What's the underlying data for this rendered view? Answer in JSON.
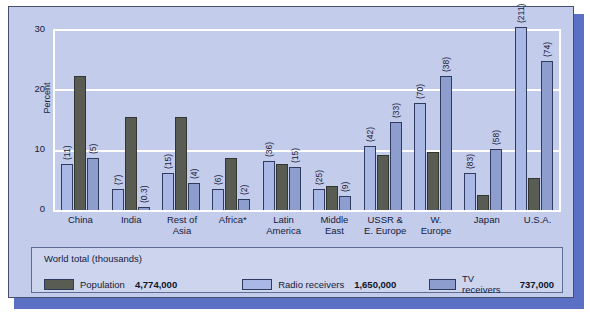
{
  "chart_data": {
    "type": "bar",
    "title": "",
    "xlabel": "",
    "ylabel": "Percent",
    "ylim": [
      0,
      30
    ],
    "yticks": [
      0,
      10,
      20,
      30
    ],
    "grid": true,
    "legend_position": "bottom-panel",
    "categories": [
      "China",
      "India",
      "Rest of Asia",
      "Africa*",
      "Latin America",
      "Middle East",
      "USSR & E. Europe",
      "W. Europe",
      "Japan",
      "U.S.A."
    ],
    "category_lines": [
      [
        "China"
      ],
      [
        "India"
      ],
      [
        "Rest of",
        "Asia"
      ],
      [
        "Africa*"
      ],
      [
        "Latin",
        "America"
      ],
      [
        "Middle",
        "East"
      ],
      [
        "USSR &",
        "E. Europe"
      ],
      [
        "W.",
        "Europe"
      ],
      [
        "Japan"
      ],
      [
        "U.S.A."
      ]
    ],
    "series": [
      {
        "name": "Radio receivers",
        "color": "#a9b8e4",
        "values": [
          7.5,
          3.5,
          6.0,
          3.5,
          8.0,
          3.5,
          10.5,
          17.5,
          6.0,
          30.0
        ]
      },
      {
        "name": "Population",
        "color": "#595c52",
        "values": [
          22.0,
          15.3,
          15.2,
          8.5,
          7.5,
          4.0,
          9.0,
          9.5,
          2.5,
          5.2
        ]
      },
      {
        "name": "TV receivers",
        "color": "#8d9dcd",
        "values": [
          8.5,
          0.5,
          4.5,
          1.8,
          7.0,
          2.3,
          14.5,
          22.0,
          10.0,
          24.5
        ]
      }
    ],
    "annotations": {
      "note": "Per-bar parenthesised receiver counts shown rotated beside bars",
      "radio_labels": [
        "(11)",
        "(7)",
        "(15)",
        "(6)",
        "(36)",
        "(25)",
        "(42)",
        "(70)",
        "(83)",
        "(211)"
      ],
      "tv_labels": [
        "(5)",
        "(0.3)",
        "(4)",
        "(2)",
        "(15)",
        "(9)",
        "(33)",
        "(38)",
        "(58)",
        "(74)"
      ]
    }
  },
  "legend": {
    "title": "World total (thousands)",
    "items": [
      {
        "label": "Population",
        "value": "4,774,000",
        "color": "#595c52"
      },
      {
        "label": "Radio receivers",
        "value": "1,650,000",
        "color": "#a9b8e4"
      },
      {
        "label": "TV receivers",
        "value": "737,000",
        "color": "#8d9dcd"
      }
    ]
  },
  "colors": {
    "card_background": "#c3ccea",
    "legend_background": "#ccd4ee",
    "shadow_plate": "#5b6fc4",
    "gridline": "#ffffff",
    "text": "#16203c"
  }
}
